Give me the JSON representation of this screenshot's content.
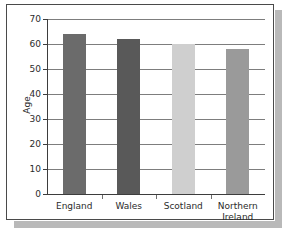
{
  "chart_data": {
    "type": "bar",
    "title": "",
    "xlabel": "",
    "ylabel": "Age",
    "categories": [
      "England",
      "Wales",
      "Scotland",
      "Northern Ireland"
    ],
    "values": [
      64,
      62,
      60,
      58
    ],
    "ylim": [
      0,
      70
    ],
    "ytick_labels": [
      "0",
      "10",
      "20",
      "30",
      "40",
      "50",
      "60",
      "70"
    ],
    "ytick_values": [
      0,
      10,
      20,
      30,
      40,
      50,
      60,
      70
    ],
    "grid": true,
    "legend": "none",
    "bar_colors": [
      "#6b6b6b",
      "#595959",
      "#cfcfcf",
      "#9a9a9a"
    ],
    "axis_color": "#3d3d3d",
    "gridline_color": "#7d7d7d",
    "background": "#ffffff",
    "border_color": "#4a4a4a",
    "shadow_color": "#b9b9b9"
  }
}
